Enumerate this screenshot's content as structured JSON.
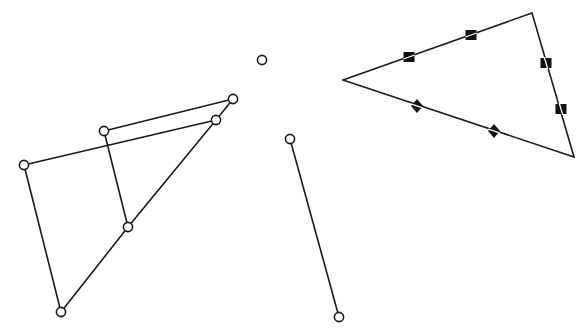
{
  "diagram": {
    "width": 586,
    "height": 332,
    "colors": {
      "stroke": "#1a1a1a",
      "background": "#ffffff",
      "marker_fill": "#111111"
    },
    "figures": [
      {
        "id": "quadrilateral-figure",
        "points": {
          "A": [
            233,
            99
          ],
          "B": [
            216,
            120
          ],
          "C": [
            104,
            131
          ],
          "D": [
            24,
            165
          ],
          "E": [
            128,
            227
          ],
          "F": [
            61,
            312
          ]
        },
        "segments": [
          [
            "C",
            "A"
          ],
          [
            "D",
            "B"
          ],
          [
            "A",
            "B"
          ],
          [
            "D",
            "F"
          ],
          [
            "F",
            "E"
          ],
          [
            "E",
            "B"
          ],
          [
            "C",
            "E"
          ]
        ]
      },
      {
        "id": "isolated-point",
        "points": {
          "P": [
            262,
            60
          ]
        },
        "segments": []
      },
      {
        "id": "line-segment",
        "points": {
          "S1": [
            290,
            139
          ],
          "S2": [
            339,
            317
          ]
        },
        "segments": [
          [
            "S1",
            "S2"
          ]
        ]
      },
      {
        "id": "marked-triangle",
        "vertices": {
          "L": [
            343,
            80
          ],
          "T": [
            532,
            13
          ],
          "R": [
            574,
            157
          ]
        },
        "sides": [
          [
            "L",
            "T"
          ],
          [
            "T",
            "R"
          ],
          [
            "R",
            "L"
          ]
        ],
        "markers": [
          {
            "shape": "square",
            "at": [
              409,
              57
            ]
          },
          {
            "shape": "square",
            "at": [
              471,
              35
            ]
          },
          {
            "shape": "square",
            "at": [
              546,
              63
            ]
          },
          {
            "shape": "square",
            "at": [
              561,
              109
            ]
          },
          {
            "shape": "diamond",
            "at": [
              417,
              106
            ]
          },
          {
            "shape": "diamond",
            "at": [
              494,
              131
            ]
          }
        ]
      }
    ]
  }
}
